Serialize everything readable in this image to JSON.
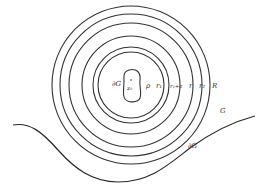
{
  "diagram": {
    "type": "concentric-circles-domain",
    "center": {
      "x": 131,
      "y": 85
    },
    "rings": [
      {
        "name": "rho",
        "label": "ρ",
        "radius": 33
      },
      {
        "name": "r1",
        "label": "r₁",
        "radius": 38
      },
      {
        "name": "r1-plus-epsilon",
        "label": "r₁+ε",
        "radius": 49
      },
      {
        "name": "r",
        "label": "r",
        "radius": 62
      },
      {
        "name": "r2",
        "label": "r₂",
        "radius": 71
      },
      {
        "name": "R",
        "label": "R",
        "radius": 79
      }
    ],
    "inner_region": {
      "boundary_label": "∂G",
      "point_label": "z₀"
    },
    "outer_region": {
      "region_label": "G",
      "boundary_label": "∂G"
    },
    "stroke_color": "#333333",
    "background": "#ffffff"
  }
}
